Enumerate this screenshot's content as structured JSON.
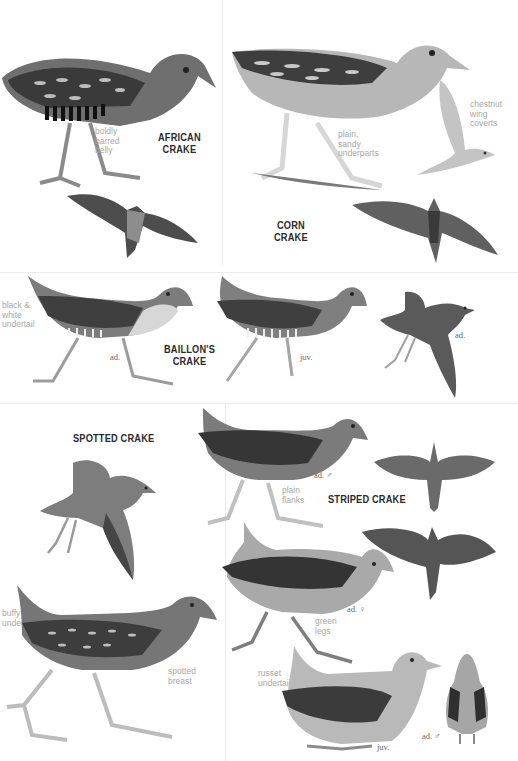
{
  "page": {
    "background": "#ffffff",
    "ink": "#2b2b2b",
    "note_color": "#a8a8a8"
  },
  "species": {
    "african": {
      "title_l1": "AFRICAN",
      "title_l2": "CRAKE",
      "note": [
        "boldly",
        "barred",
        "belly"
      ]
    },
    "corn": {
      "title_l1": "CORN",
      "title_l2": "CRAKE",
      "note_underparts": [
        "plain,",
        "sandy",
        "underparts"
      ],
      "note_wing": [
        "chestnut",
        "wing",
        "coverts"
      ]
    },
    "baillons": {
      "title_l1": "BAILLON'S",
      "title_l2": "CRAKE",
      "note": [
        "black &",
        "white",
        "undertail"
      ],
      "age_ad": "ad.",
      "age_juv": "juv.",
      "age_flight": "ad."
    },
    "spotted": {
      "title": "SPOTTED CRAKE",
      "note_undertail": [
        "buffy",
        "undertail"
      ],
      "note_breast": [
        "spotted",
        "breast"
      ]
    },
    "striped": {
      "title": "STRIPED CRAKE",
      "male_label": "ad. ♂",
      "note_flanks": [
        "plain",
        "flanks"
      ],
      "female_label": "ad. ♀",
      "note_legs": [
        "green",
        "legs"
      ],
      "note_undertail": [
        "russet",
        "undertail"
      ],
      "juv_label": "juv.",
      "rear_label": "ad. ♂"
    }
  }
}
